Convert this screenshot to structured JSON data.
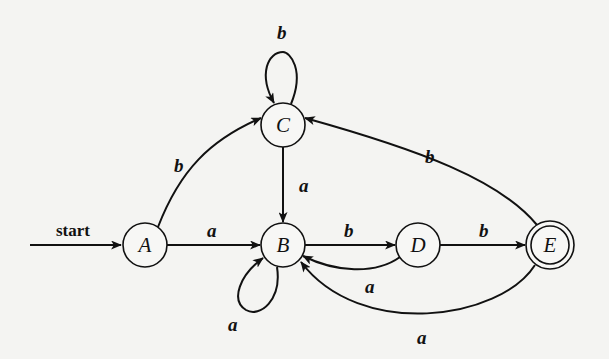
{
  "diagram": {
    "type": "finite-automaton",
    "start_label": "start",
    "start_state": "A",
    "accepting_states": [
      "E"
    ],
    "states": [
      {
        "id": "A",
        "label": "A",
        "cx": 145,
        "cy": 245
      },
      {
        "id": "B",
        "label": "B",
        "cx": 283,
        "cy": 245
      },
      {
        "id": "C",
        "label": "C",
        "cx": 283,
        "cy": 125
      },
      {
        "id": "D",
        "label": "D",
        "cx": 418,
        "cy": 245
      },
      {
        "id": "E",
        "label": "E",
        "cx": 550,
        "cy": 245
      }
    ],
    "transitions": [
      {
        "from": "A",
        "to": "B",
        "symbol": "a"
      },
      {
        "from": "A",
        "to": "C",
        "symbol": "b"
      },
      {
        "from": "B",
        "to": "B",
        "symbol": "a"
      },
      {
        "from": "B",
        "to": "D",
        "symbol": "b"
      },
      {
        "from": "C",
        "to": "B",
        "symbol": "a"
      },
      {
        "from": "C",
        "to": "C",
        "symbol": "b"
      },
      {
        "from": "D",
        "to": "B",
        "symbol": "a"
      },
      {
        "from": "D",
        "to": "E",
        "symbol": "b"
      },
      {
        "from": "E",
        "to": "B",
        "symbol": "a"
      },
      {
        "from": "E",
        "to": "C",
        "symbol": "b"
      }
    ],
    "edge_labels": {
      "C_C": "b",
      "A_C": "b",
      "C_B": "a",
      "A_B": "a",
      "B_D": "b",
      "D_E": "b",
      "E_C": "b",
      "D_B": "a",
      "B_B": "a",
      "E_B": "a"
    },
    "colors": {
      "ink": "#111111",
      "paper": "#f4f4f2"
    }
  }
}
